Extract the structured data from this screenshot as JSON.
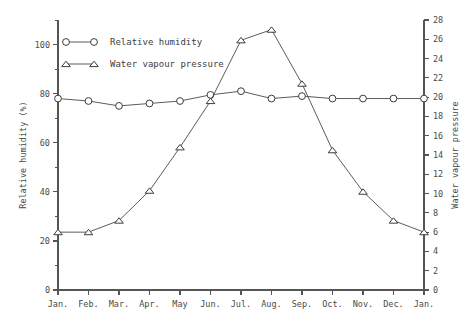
{
  "chart_data": {
    "type": "line",
    "title": "",
    "subtitle": "",
    "xlabel": "",
    "ylabel": "Relative humidity (%)",
    "y2label": "Water vapour pressure",
    "grid": false,
    "legend_position": "top-left",
    "categories": [
      "Jan.",
      "Feb.",
      "Mar.",
      "Apr.",
      "May",
      "Jun.",
      "Jul.",
      "Aug.",
      "Sep.",
      "Oct.",
      "Nov.",
      "Dec.",
      "Jan."
    ],
    "ylim": [
      0,
      110
    ],
    "yticks": [
      0,
      20,
      40,
      60,
      80,
      100
    ],
    "yticklabels": [
      "0",
      "20",
      "40",
      "60",
      "80",
      "100"
    ],
    "y2lim": [
      0,
      28
    ],
    "y2ticks": [
      0,
      2,
      4,
      6,
      8,
      10,
      12,
      14,
      16,
      18,
      20,
      22,
      24,
      26,
      28
    ],
    "y2ticklabels": [
      "0",
      "2",
      "4",
      "6",
      "8",
      "10",
      "12",
      "14",
      "16",
      "18",
      "20",
      "22",
      "24",
      "26",
      "28"
    ],
    "series": [
      {
        "name": "Relative humidity",
        "axis": "left",
        "marker": "circle",
        "values": [
          78,
          77,
          75,
          76,
          77,
          79.5,
          81,
          78,
          79,
          78,
          78,
          78,
          78
        ]
      },
      {
        "name": "Water vapour pressure",
        "axis": "right",
        "marker": "triangle",
        "values": [
          6.0,
          6.0,
          7.2,
          10.3,
          14.8,
          19.6,
          25.9,
          27.0,
          21.4,
          14.5,
          10.2,
          7.2,
          6.0
        ]
      }
    ]
  },
  "legend": {
    "entries": [
      {
        "label": "Relative humidity",
        "marker": "circle"
      },
      {
        "label": "Water vapour pressure",
        "marker": "triangle"
      }
    ]
  },
  "colors": {
    "axis": "#555555",
    "line": "#4a4a4a",
    "marker_fill": "#ffffff",
    "marker_stroke": "#3d3d3d",
    "text": "#4a4a4a",
    "background": "#ffffff"
  }
}
